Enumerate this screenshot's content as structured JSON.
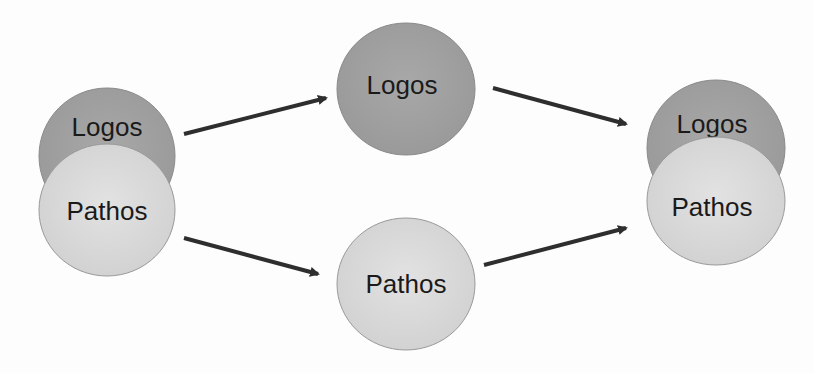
{
  "diagram": {
    "colors": {
      "logos_fill": "#a3a3a3",
      "pathos_fill": "#dcdcdc",
      "stroke": "#8a8a8a",
      "arrow": "#2e2e2e"
    },
    "left_group": {
      "logos_label": "Logos",
      "pathos_label": "Pathos"
    },
    "middle_top": {
      "label": "Logos"
    },
    "middle_bottom": {
      "label": "Pathos"
    },
    "right_group": {
      "logos_label": "Logos",
      "pathos_label": "Pathos"
    },
    "arrows": [
      {
        "from": "left_group",
        "to": "middle_top"
      },
      {
        "from": "left_group",
        "to": "middle_bottom"
      },
      {
        "from": "middle_top",
        "to": "right_group"
      },
      {
        "from": "middle_bottom",
        "to": "right_group"
      }
    ]
  }
}
